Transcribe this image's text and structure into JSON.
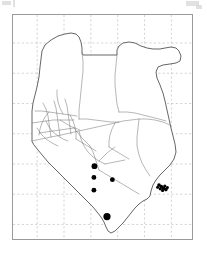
{
  "figure": {
    "kind": "distribution-map",
    "region": "Kenya",
    "frame_visible": true,
    "grid_visible": true,
    "grid_style": "dashed",
    "colors": {
      "background": "#ffffff",
      "frame": "#9a9a9a",
      "grid": "#b9b9b9",
      "country_outline": "#4a4a4a",
      "district_outline": "#6f6f6f",
      "marker": "#000000"
    }
  },
  "map_data": {
    "type": "point-distribution",
    "title": "",
    "xlabel": "",
    "ylabel": "",
    "tick_labels_visible": false,
    "legend_visible": false,
    "grid": {
      "vertical_fractions": [
        0.135,
        0.285,
        0.435,
        0.585,
        0.735,
        0.885
      ],
      "horizontal_fractions": [
        0.125,
        0.26,
        0.395,
        0.53,
        0.665,
        0.8,
        0.935
      ]
    },
    "markers": [
      {
        "id": "pt-1",
        "x": 0.455,
        "y": 0.675,
        "r": 2.9,
        "shape": "filled-circle"
      },
      {
        "id": "pt-2",
        "x": 0.452,
        "y": 0.725,
        "r": 2.4,
        "shape": "filled-circle"
      },
      {
        "id": "pt-3",
        "x": 0.452,
        "y": 0.782,
        "r": 2.4,
        "shape": "filled-circle"
      },
      {
        "id": "pt-4",
        "x": 0.555,
        "y": 0.735,
        "r": 2.4,
        "shape": "filled-circle"
      },
      {
        "id": "pt-5",
        "x": 0.525,
        "y": 0.9,
        "r": 3.6,
        "shape": "filled-circle"
      }
    ],
    "marker_count": 5,
    "coast_cluster": {
      "id": "coast-cluster",
      "present": true,
      "x": 0.825,
      "y": 0.77,
      "description": "dense overlapping markers along the coastline"
    }
  },
  "geometry": {
    "country_outline_note": "Kenya national boundary",
    "district_note": "internal administrative district boundaries"
  }
}
